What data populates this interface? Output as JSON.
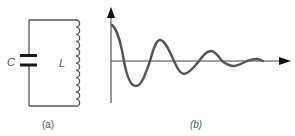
{
  "panel_a": {
    "title": "LC circuit",
    "caption": "(a)",
    "capacitor_label": "C",
    "inductor_label": "L",
    "components": [
      {
        "type": "capacitor",
        "label": "C",
        "position": "left branch"
      },
      {
        "type": "inductor",
        "label": "L",
        "position": "right branch",
        "turns": 12
      }
    ]
  },
  "panel_b": {
    "title": "Damped oscillation",
    "caption": "(b)",
    "x_axis": {
      "label": "",
      "arrow": true
    },
    "y_axis": {
      "label": "",
      "arrow": true
    },
    "curve": "damped sinusoid decaying to zero"
  },
  "colors": {
    "line": "#555555",
    "plate": "#1a1a1a",
    "arrow": "#111111",
    "background": "#ffffff"
  }
}
